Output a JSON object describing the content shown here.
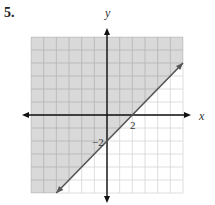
{
  "problem": {
    "number": "5."
  },
  "chart_data": {
    "type": "line",
    "title": "",
    "xlabel": "x",
    "ylabel": "y",
    "xlim": [
      -6,
      6
    ],
    "ylim": [
      -6,
      6
    ],
    "grid": true,
    "series": [
      {
        "name": "boundary line y = x - 2",
        "style": "solid",
        "x": [
          -4,
          6
        ],
        "values": [
          -6,
          4
        ],
        "slope": 1,
        "intercept": -2
      }
    ],
    "shaded_region": "above the line (y > x - 2)",
    "annotations": [
      {
        "text": "2",
        "x": 2,
        "y": 0,
        "meaning": "x-intercept"
      },
      {
        "text": "-2",
        "x": 0,
        "y": -2,
        "meaning": "y-intercept"
      }
    ]
  },
  "labels": {
    "x_axis": "x",
    "y_axis": "y",
    "x_intercept": "2",
    "y_intercept": "−2"
  },
  "colors": {
    "shade": "#d9d9d9",
    "shade_grid": "#b4b4b4",
    "plain_grid": "#d6d6d6",
    "axis": "#111111",
    "line": "#555555"
  }
}
